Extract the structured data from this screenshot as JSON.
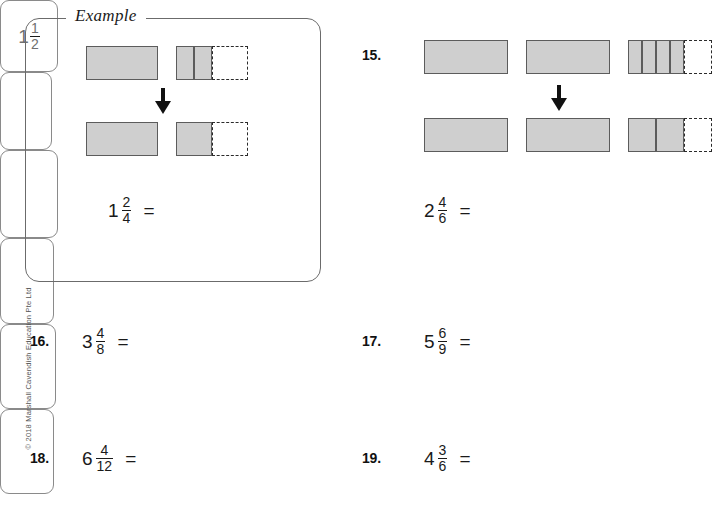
{
  "page": {
    "copyright": "© 2018 Marshall Cavendish Education Pte Ltd"
  },
  "example": {
    "label": "Example",
    "equation": {
      "whole": "1",
      "numerator": "2",
      "denominator": "4",
      "equals": "="
    },
    "answer": {
      "whole": "1",
      "numerator": "1",
      "denominator": "2"
    },
    "arrow_icon": "down-arrow-icon",
    "top_model": [
      {
        "shaded_parts": 1,
        "empty_parts": 0,
        "width": 72
      },
      {
        "shaded_parts": 2,
        "empty_parts": 2,
        "width": 72
      }
    ],
    "bottom_model": [
      {
        "shaded_parts": 1,
        "empty_parts": 0,
        "width": 72
      },
      {
        "shaded_parts": 1,
        "empty_parts": 1,
        "width": 72
      }
    ]
  },
  "problems": [
    {
      "number": "15.",
      "whole": "2",
      "numerator": "4",
      "denominator": "6",
      "equals": "=",
      "answer": "",
      "has_model": true,
      "arrow_icon": "down-arrow-icon",
      "top_model": [
        {
          "shaded_parts": 1,
          "empty_parts": 0,
          "width": 84
        },
        {
          "shaded_parts": 1,
          "empty_parts": 0,
          "width": 84
        },
        {
          "shaded_parts": 4,
          "empty_parts": 2,
          "width": 84
        }
      ],
      "bottom_model": [
        {
          "shaded_parts": 1,
          "empty_parts": 0,
          "width": 84
        },
        {
          "shaded_parts": 1,
          "empty_parts": 0,
          "width": 84
        },
        {
          "shaded_parts": 2,
          "empty_parts": 1,
          "width": 84
        }
      ]
    },
    {
      "number": "16.",
      "whole": "3",
      "numerator": "4",
      "denominator": "8",
      "equals": "=",
      "answer": "",
      "has_model": false
    },
    {
      "number": "17.",
      "whole": "5",
      "numerator": "6",
      "denominator": "9",
      "equals": "=",
      "answer": "",
      "has_model": false
    },
    {
      "number": "18.",
      "whole": "6",
      "numerator": "4",
      "denominator": "12",
      "equals": "=",
      "answer": "",
      "has_model": false
    },
    {
      "number": "19.",
      "whole": "4",
      "numerator": "3",
      "denominator": "6",
      "equals": "=",
      "answer": "",
      "has_model": false
    }
  ],
  "colors": {
    "shaded_fill": "#cfcfcf",
    "bar_stroke": "#5c5c5c",
    "dashed_stroke": "#2b2b2b",
    "answer_box_border": "#8a8a8a",
    "answer_text": "#6f6f6f"
  }
}
